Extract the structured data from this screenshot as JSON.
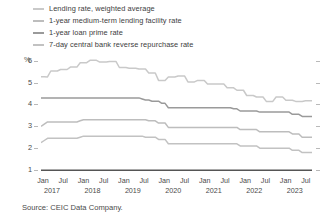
{
  "legend": {
    "items": [
      {
        "label": "Lending rate, weighted average",
        "color": "#c9c9c9",
        "key": "lending_weighted_avg"
      },
      {
        "label": "1-year medium-term lending facility rate",
        "color": "#bdbdbd",
        "key": "mlf_1y"
      },
      {
        "label": "1-year loan prime rate",
        "color": "#9a9a9a",
        "key": "lpr_1y"
      },
      {
        "label": "7-day central bank reverse repurchase rate",
        "color": "#c2c2c2",
        "key": "reverse_repo_7d"
      }
    ]
  },
  "source": "Source: CEIC Data Company.",
  "chart_data": {
    "type": "line",
    "title": "",
    "xlabel": "",
    "ylabel": "%",
    "ylim": [
      1,
      6.4
    ],
    "yticks": [
      1,
      2,
      3,
      4,
      5,
      6
    ],
    "grid": false,
    "legend_position": "top",
    "x_months": [
      "Jan",
      "Jul",
      "Jan",
      "Jul",
      "Jan",
      "Jul",
      "Jan",
      "Jul",
      "Jan",
      "Jul",
      "Jan",
      "Jul",
      "Jan",
      "Jul"
    ],
    "x_years": [
      "2017",
      "",
      "2018",
      "",
      "2019",
      "",
      "2020",
      "",
      "2021",
      "",
      "2022",
      "",
      "2023",
      ""
    ],
    "x_start": "2017-01",
    "x_end": "2023-12",
    "series": [
      {
        "name": "Lending rate, weighted average",
        "color": "#c9c9c9",
        "values": [
          5.27,
          5.27,
          5.26,
          5.53,
          5.53,
          5.53,
          5.6,
          5.6,
          5.6,
          5.71,
          5.71,
          5.71,
          5.91,
          5.91,
          5.91,
          6.02,
          6.02,
          6.02,
          5.94,
          5.94,
          5.94,
          5.96,
          5.96,
          5.96,
          5.69,
          5.69,
          5.69,
          5.66,
          5.66,
          5.66,
          5.62,
          5.62,
          5.62,
          5.44,
          5.44,
          5.44,
          5.1,
          5.1,
          5.1,
          5.26,
          5.26,
          5.26,
          5.3,
          5.3,
          5.3,
          5.03,
          5.03,
          5.03,
          5.1,
          5.1,
          5.1,
          4.93,
          4.93,
          4.93,
          4.93,
          4.93,
          4.93,
          4.76,
          4.76,
          4.76,
          4.65,
          4.65,
          4.65,
          4.41,
          4.41,
          4.41,
          4.34,
          4.34,
          4.34,
          4.14,
          4.14,
          4.14,
          4.34,
          4.34,
          4.34,
          4.19,
          4.19,
          4.19,
          4.14,
          4.14,
          4.14,
          4.17,
          4.17,
          4.17
        ]
      },
      {
        "name": "1-year loan prime rate",
        "color": "#9a9a9a",
        "values": [
          4.3,
          4.3,
          4.3,
          4.3,
          4.3,
          4.3,
          4.3,
          4.3,
          4.3,
          4.3,
          4.3,
          4.3,
          4.3,
          4.3,
          4.3,
          4.3,
          4.3,
          4.3,
          4.3,
          4.3,
          4.3,
          4.3,
          4.3,
          4.3,
          4.3,
          4.3,
          4.3,
          4.3,
          4.3,
          4.3,
          4.3,
          4.25,
          4.2,
          4.2,
          4.15,
          4.15,
          4.15,
          4.05,
          4.05,
          3.85,
          3.85,
          3.85,
          3.85,
          3.85,
          3.85,
          3.85,
          3.85,
          3.85,
          3.85,
          3.85,
          3.85,
          3.85,
          3.85,
          3.85,
          3.85,
          3.85,
          3.85,
          3.85,
          3.85,
          3.8,
          3.8,
          3.7,
          3.7,
          3.7,
          3.7,
          3.7,
          3.7,
          3.65,
          3.65,
          3.65,
          3.65,
          3.65,
          3.65,
          3.65,
          3.65,
          3.65,
          3.65,
          3.55,
          3.55,
          3.55,
          3.45,
          3.45,
          3.45,
          3.45
        ]
      },
      {
        "name": "1-year medium-term lending facility rate",
        "color": "#bdbdbd",
        "values": [
          3.0,
          3.1,
          3.2,
          3.2,
          3.2,
          3.2,
          3.2,
          3.2,
          3.2,
          3.2,
          3.2,
          3.2,
          3.25,
          3.3,
          3.3,
          3.3,
          3.3,
          3.3,
          3.3,
          3.3,
          3.3,
          3.3,
          3.3,
          3.3,
          3.3,
          3.3,
          3.3,
          3.3,
          3.3,
          3.3,
          3.3,
          3.3,
          3.3,
          3.25,
          3.25,
          3.25,
          3.15,
          3.15,
          3.15,
          2.95,
          2.95,
          2.95,
          2.95,
          2.95,
          2.95,
          2.95,
          2.95,
          2.95,
          2.95,
          2.95,
          2.95,
          2.95,
          2.95,
          2.95,
          2.95,
          2.95,
          2.95,
          2.95,
          2.95,
          2.95,
          2.95,
          2.85,
          2.85,
          2.85,
          2.85,
          2.85,
          2.85,
          2.75,
          2.75,
          2.75,
          2.75,
          2.75,
          2.75,
          2.75,
          2.75,
          2.75,
          2.75,
          2.65,
          2.65,
          2.65,
          2.5,
          2.5,
          2.5,
          2.5
        ]
      },
      {
        "name": "7-day central bank reverse repurchase rate",
        "color": "#c2c2c2",
        "values": [
          2.25,
          2.35,
          2.45,
          2.45,
          2.45,
          2.45,
          2.45,
          2.45,
          2.45,
          2.45,
          2.45,
          2.45,
          2.5,
          2.55,
          2.55,
          2.55,
          2.55,
          2.55,
          2.55,
          2.55,
          2.55,
          2.55,
          2.55,
          2.55,
          2.55,
          2.55,
          2.55,
          2.55,
          2.55,
          2.55,
          2.55,
          2.55,
          2.5,
          2.5,
          2.5,
          2.5,
          2.4,
          2.4,
          2.4,
          2.2,
          2.2,
          2.2,
          2.2,
          2.2,
          2.2,
          2.2,
          2.2,
          2.2,
          2.2,
          2.2,
          2.2,
          2.2,
          2.2,
          2.2,
          2.2,
          2.2,
          2.2,
          2.2,
          2.2,
          2.2,
          2.2,
          2.1,
          2.1,
          2.1,
          2.1,
          2.1,
          2.1,
          2.0,
          2.0,
          2.0,
          2.0,
          2.0,
          2.0,
          2.0,
          2.0,
          2.0,
          2.0,
          1.9,
          1.9,
          1.9,
          1.8,
          1.8,
          1.8,
          1.8
        ]
      }
    ],
    "baseline": {
      "value": 1.0,
      "color": "#555555"
    }
  }
}
